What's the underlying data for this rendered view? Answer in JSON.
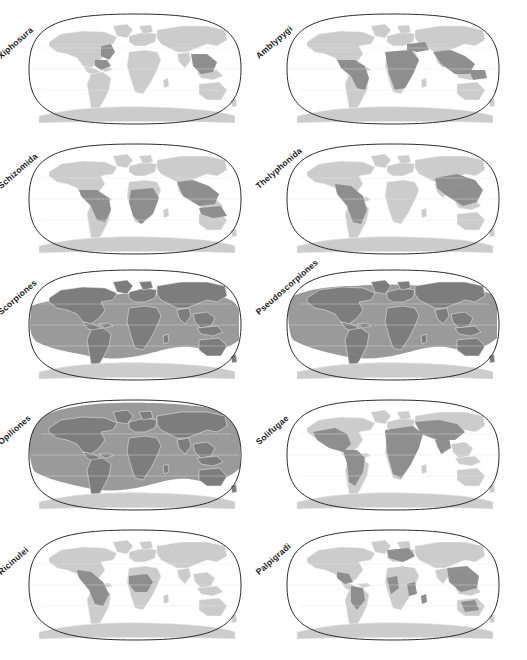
{
  "figure": {
    "layout": {
      "rows": 5,
      "cols": 2,
      "panel_count": 10
    },
    "projection": "Robinson",
    "colors": {
      "ocean": "#ffffff",
      "land_absent": "#cccccc",
      "land_present": "#8a8a8a",
      "band_present": "#9a9a9a",
      "outline": "#2b2b2b",
      "border": "#f2f2f2",
      "label_text": "#1a1a1a"
    }
  },
  "panels": [
    {
      "id": "xiphosura",
      "label": "Xiphosura",
      "row": 0,
      "col": 0,
      "range_type": "coastal",
      "description": "Atlantic coast of North America, Gulf of Mexico, Southeast Asia coasts",
      "regions": [
        "eastern North America",
        "Gulf of Mexico",
        "South and Southeast Asia coasts"
      ]
    },
    {
      "id": "amblypygi",
      "label": "Amblypygi",
      "row": 0,
      "col": 1,
      "range_type": "pantropical",
      "description": "Neotropics, sub-Saharan Africa, Sahara oases, India, Southeast Asia, northern Australia",
      "regions": [
        "Central America",
        "northern South America",
        "sub-Saharan Africa",
        "Sahara",
        "Arabia",
        "India",
        "Southeast Asia",
        "New Guinea"
      ]
    },
    {
      "id": "schizomida",
      "label": "Schizomida",
      "row": 1,
      "col": 0,
      "range_type": "pantropical",
      "description": "Tropical Americas, central and southern Africa, India, Southeast Asia, northern Australia",
      "regions": [
        "Mexico",
        "Central America",
        "Amazonia",
        "Central Africa",
        "Southern Africa",
        "India",
        "Indochina",
        "Indonesia",
        "northern Australia"
      ]
    },
    {
      "id": "thelyphonida",
      "label": "Thelyphonida",
      "row": 1,
      "col": 1,
      "range_type": "disjunct-tropical",
      "description": "Tropical Americas and South / Southeast Asia; absent from Africa",
      "regions": [
        "southern North America",
        "Central America",
        "Amazonia",
        "India",
        "China",
        "Southeast Asia",
        "Indonesia"
      ]
    },
    {
      "id": "scorpiones",
      "label": "Scorpiones",
      "row": 2,
      "col": 0,
      "range_type": "broad-band",
      "description": "Near-global band between roughly 50 N and 50 S, including ocean islands",
      "regions": [
        "all continents except Antarctica",
        "temperate to tropical latitudes"
      ]
    },
    {
      "id": "pseudoscorpiones",
      "label": "Pseudoscorpiones",
      "row": 2,
      "col": 1,
      "range_type": "broad-band",
      "description": "Near-cosmopolitan band reaching higher northern latitudes than Scorpiones",
      "regions": [
        "all continents except Antarctica",
        "boreal to tropical latitudes"
      ]
    },
    {
      "id": "opiliones",
      "label": "Opiliones",
      "row": 3,
      "col": 0,
      "range_type": "cosmopolitan",
      "description": "Cosmopolitan; all landmasses except Antarctica, extending into the Arctic",
      "regions": [
        "worldwide except Antarctica"
      ]
    },
    {
      "id": "solifugae",
      "label": "Solifugae",
      "row": 3,
      "col": 1,
      "range_type": "arid",
      "description": "Arid and semi-arid regions: Americas, Africa, Middle East, Central and South Asia; absent from Australia",
      "regions": [
        "southwestern North America",
        "Mexico",
        "dry South America",
        "Africa",
        "Arabia",
        "Central Asia",
        "India"
      ]
    },
    {
      "id": "ricinulei",
      "label": "Ricinulei",
      "row": 4,
      "col": 0,
      "range_type": "disjunct-tropical",
      "description": "Neotropics (Mexico to Amazonia) and West / Central Africa only",
      "regions": [
        "Mexico",
        "Central America",
        "Amazonia",
        "West Africa",
        "Central Africa"
      ]
    },
    {
      "id": "palpigradi",
      "label": "Palpigradi",
      "row": 4,
      "col": 1,
      "range_type": "scattered",
      "description": "Scattered records: Mediterranean Europe, Americas, Africa, Southeast Asia, Australia",
      "regions": [
        "Mediterranean",
        "Mexico",
        "South America",
        "West Africa",
        "Madagascar",
        "Southeast Asia",
        "Australia"
      ]
    }
  ]
}
